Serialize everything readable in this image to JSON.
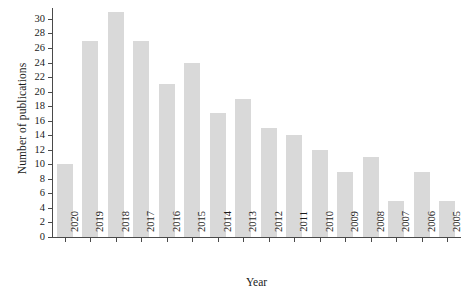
{
  "chart_data": {
    "type": "bar",
    "title": "",
    "subtitle": "",
    "xlabel": "Year",
    "ylabel": "Number of publications",
    "categories": [
      "2020",
      "2019",
      "2018",
      "2017",
      "2016",
      "2015",
      "2014",
      "2013",
      "2012",
      "2011",
      "2010",
      "2009",
      "2008",
      "2007",
      "2006",
      "2005"
    ],
    "values": [
      10,
      27,
      31,
      27,
      21,
      24,
      17,
      19,
      15,
      14,
      12,
      9,
      11,
      5,
      9,
      5
    ],
    "series": [
      {
        "name": "Number of publications",
        "values": [
          10,
          27,
          31,
          27,
          21,
          24,
          17,
          19,
          15,
          14,
          12,
          9,
          11,
          5,
          9,
          5
        ]
      }
    ],
    "ylim": [
      0,
      31.5
    ],
    "yticks": [
      0,
      2,
      4,
      6,
      8,
      10,
      12,
      14,
      16,
      18,
      20,
      22,
      24,
      26,
      28,
      30
    ],
    "ytick_labels": [
      "0",
      "2",
      "4",
      "6",
      "8",
      "10",
      "12",
      "14",
      "16",
      "18",
      "20",
      "22",
      "24",
      "26",
      "28",
      "30"
    ],
    "grid": false,
    "legend": false,
    "legend_position": "none",
    "bar_color": "#d9d9d9",
    "axis_color": "#4a4a4a",
    "background_color": "#ffffff",
    "xtick_rotation": -90
  }
}
